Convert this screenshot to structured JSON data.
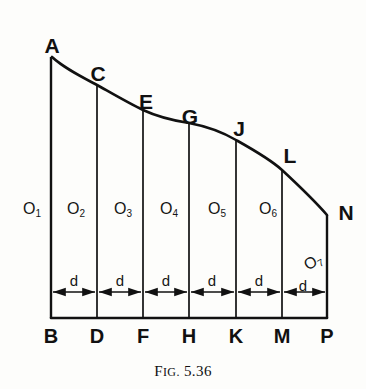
{
  "figure": {
    "caption_prefix": "F",
    "caption_smallcaps": "IG.",
    "caption_number": "5.36",
    "caption_full": "FIG. 5.36",
    "line_color": "#111111",
    "background_color": "#fdfdfb"
  },
  "curve_points": [
    {
      "label": "A",
      "x": 52,
      "y": 57
    },
    {
      "label": "C",
      "x": 97,
      "y": 85
    },
    {
      "label": "E",
      "x": 143,
      "y": 110
    },
    {
      "label": "G",
      "x": 189,
      "y": 123
    },
    {
      "label": "J",
      "x": 236,
      "y": 140
    },
    {
      "label": "L",
      "x": 282,
      "y": 170
    },
    {
      "label": "N",
      "x": 327,
      "y": 215
    }
  ],
  "vertex_labels": [
    {
      "text": "A",
      "x": 52,
      "y": 45
    },
    {
      "text": "C",
      "x": 98,
      "y": 73
    },
    {
      "text": "E",
      "x": 146,
      "y": 101
    },
    {
      "text": "G",
      "x": 190,
      "y": 116
    },
    {
      "text": "J",
      "x": 239,
      "y": 128
    },
    {
      "text": "L",
      "x": 290,
      "y": 155
    },
    {
      "text": "N",
      "x": 346,
      "y": 212
    }
  ],
  "base_labels": [
    {
      "text": "B",
      "x": 51,
      "y": 336
    },
    {
      "text": "D",
      "x": 97,
      "y": 336
    },
    {
      "text": "F",
      "x": 143,
      "y": 336
    },
    {
      "text": "H",
      "x": 189,
      "y": 336
    },
    {
      "text": "K",
      "x": 236,
      "y": 336
    },
    {
      "text": "M",
      "x": 282,
      "y": 336
    },
    {
      "text": "P",
      "x": 327,
      "y": 336
    }
  ],
  "ordinate_labels": [
    {
      "base": "O",
      "sub": "1",
      "x": 32,
      "y": 209,
      "rotated": false
    },
    {
      "base": "O",
      "sub": "2",
      "x": 76,
      "y": 209,
      "rotated": false
    },
    {
      "base": "O",
      "sub": "3",
      "x": 123,
      "y": 209,
      "rotated": false
    },
    {
      "base": "O",
      "sub": "4",
      "x": 169,
      "y": 209,
      "rotated": false
    },
    {
      "base": "O",
      "sub": "5",
      "x": 217,
      "y": 209,
      "rotated": false
    },
    {
      "base": "O",
      "sub": "6",
      "x": 268,
      "y": 209,
      "rotated": false
    },
    {
      "base": "O",
      "sub": "7",
      "x": 313,
      "y": 262,
      "rotated": true
    }
  ],
  "spacing_labels": [
    {
      "text": "d",
      "x": 74,
      "y": 280
    },
    {
      "text": "d",
      "x": 120,
      "y": 280
    },
    {
      "text": "d",
      "x": 166,
      "y": 280
    },
    {
      "text": "d",
      "x": 212,
      "y": 280
    },
    {
      "text": "d",
      "x": 259,
      "y": 280
    },
    {
      "text": "d",
      "x": 303,
      "y": 285
    }
  ],
  "geometry": {
    "baseline_y": 318,
    "dimension_line_y": 292,
    "ordinate_x_positions": [
      51,
      97,
      143,
      189,
      236,
      282,
      327
    ],
    "ordinate_top_y": [
      57,
      85,
      110,
      123,
      140,
      170,
      215
    ],
    "curve_path": "M 52,57 C 64,68 80,76 97,85 C 113,94 130,104 143,110 C 158,117 176,121 189,123 C 205,126 224,133 236,140 C 252,149 270,159 282,170 C 296,183 314,200 327,215",
    "left_edge_x": 51,
    "right_edge_x": 327
  }
}
